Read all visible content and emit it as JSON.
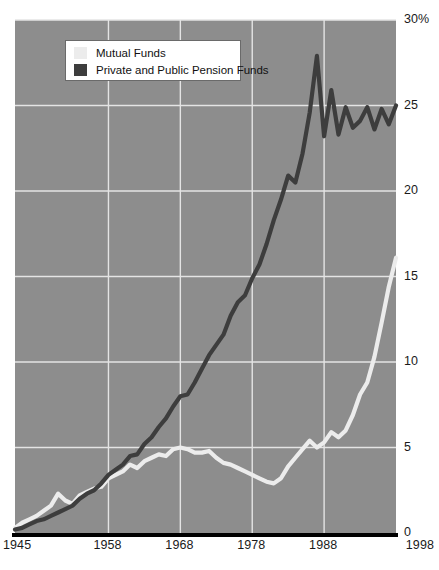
{
  "chart_data": {
    "type": "line",
    "title": "",
    "xlabel": "",
    "ylabel": "",
    "xlim": [
      1945,
      1998
    ],
    "ylim": [
      0,
      30
    ],
    "grid": true,
    "y_ticks": [
      "30%",
      "25",
      "20",
      "15",
      "10",
      "5",
      "0"
    ],
    "y_tick_values": [
      30,
      25,
      20,
      15,
      10,
      5,
      0
    ],
    "x_ticks": [
      "1945",
      "1958",
      "1968",
      "1978",
      "1988",
      "1998"
    ],
    "x_tick_values": [
      1945,
      1958,
      1968,
      1978,
      1988,
      1998
    ],
    "legend_position": "top-left",
    "plot_background": "#8d8d8d",
    "gridline_color": "#e4e4e4",
    "axis_color": "#000000",
    "series": [
      {
        "name": "Mutual Funds",
        "color": "#ececec",
        "x": [
          1945,
          1946,
          1947,
          1948,
          1949,
          1950,
          1951,
          1952,
          1953,
          1954,
          1955,
          1956,
          1957,
          1958,
          1959,
          1960,
          1961,
          1962,
          1963,
          1964,
          1965,
          1966,
          1967,
          1968,
          1969,
          1970,
          1971,
          1972,
          1973,
          1974,
          1975,
          1976,
          1977,
          1978,
          1979,
          1980,
          1981,
          1982,
          1983,
          1984,
          1985,
          1986,
          1987,
          1988,
          1989,
          1990,
          1991,
          1992,
          1993,
          1994,
          1995,
          1996,
          1997,
          1998
        ],
        "values": [
          0.3,
          0.6,
          0.8,
          1.0,
          1.3,
          1.6,
          2.3,
          1.9,
          1.7,
          2.2,
          2.4,
          2.6,
          2.7,
          3.2,
          3.4,
          3.6,
          4.0,
          3.8,
          4.2,
          4.4,
          4.6,
          4.5,
          4.9,
          5.0,
          4.9,
          4.7,
          4.7,
          4.8,
          4.4,
          4.1,
          4.0,
          3.8,
          3.6,
          3.4,
          3.2,
          3.0,
          2.9,
          3.2,
          3.9,
          4.4,
          4.9,
          5.4,
          5.0,
          5.3,
          5.9,
          5.6,
          6.0,
          6.9,
          8.1,
          8.8,
          10.3,
          12.3,
          14.4,
          16.1
        ]
      },
      {
        "name": "Private and Public Pension Funds",
        "color": "#3d3d3d",
        "x": [
          1945,
          1946,
          1947,
          1948,
          1949,
          1950,
          1951,
          1952,
          1953,
          1954,
          1955,
          1956,
          1957,
          1958,
          1959,
          1960,
          1961,
          1962,
          1963,
          1964,
          1965,
          1966,
          1967,
          1968,
          1969,
          1970,
          1971,
          1972,
          1973,
          1974,
          1975,
          1976,
          1977,
          1978,
          1979,
          1980,
          1981,
          1982,
          1983,
          1984,
          1985,
          1986,
          1987,
          1988,
          1989,
          1990,
          1991,
          1992,
          1993,
          1994,
          1995,
          1996,
          1997,
          1998
        ],
        "values": [
          0.2,
          0.3,
          0.5,
          0.7,
          0.8,
          1.0,
          1.2,
          1.4,
          1.6,
          2.0,
          2.3,
          2.5,
          2.9,
          3.4,
          3.7,
          4.0,
          4.5,
          4.6,
          5.2,
          5.6,
          6.2,
          6.7,
          7.4,
          8.0,
          8.1,
          8.8,
          9.6,
          10.4,
          11.0,
          11.6,
          12.7,
          13.5,
          13.9,
          14.9,
          15.7,
          16.9,
          18.3,
          19.5,
          20.9,
          20.5,
          22.2,
          24.6,
          27.9,
          23.2,
          25.9,
          23.3,
          24.9,
          23.7,
          24.1,
          24.9,
          23.6,
          24.8,
          23.9,
          25.0
        ]
      }
    ]
  },
  "legend": {
    "items": [
      {
        "label": "Mutual Funds",
        "color": "#ececec"
      },
      {
        "label": "Private and Public Pension Funds",
        "color": "#3d3d3d"
      }
    ]
  }
}
